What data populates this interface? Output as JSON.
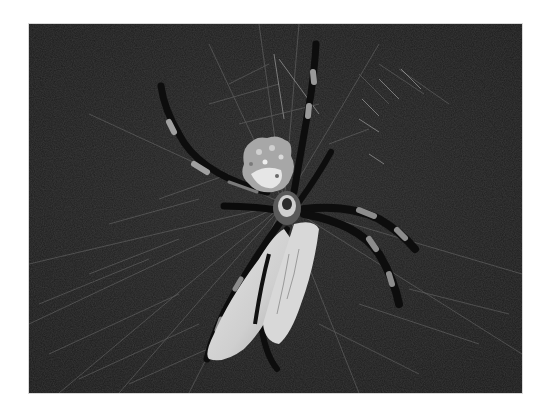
{
  "image": {
    "subject": "Spider on web wrapping prey",
    "style": "grayscale photograph",
    "colors": {
      "page_background": "#ffffff",
      "photo_background": "#1e1e1e",
      "web_strand": "#8a8a8a",
      "leg_dark": "#0c0c0c",
      "leg_band": "#9a9a9a",
      "prey_wrap": "#d6d6d6",
      "abdomen": "#bdbdbd"
    },
    "frame": {
      "x": 29,
      "y": 24,
      "width": 493,
      "height": 369
    }
  }
}
